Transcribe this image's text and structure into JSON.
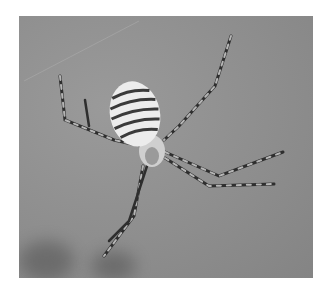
{
  "image": {
    "subject": "banded garden spider in web",
    "description": "Grayscale close-up photograph of a striped orb-weaver spider with long banded legs against a blurred gray background",
    "colors": {
      "background": "#ffffff",
      "photo_background": "#8e8e8e",
      "abdomen_light": "#ececec",
      "abdomen_dark": "#3a3a3a",
      "leg_dark": "#2a2a2a",
      "leg_light": "#b8b8b8"
    }
  }
}
